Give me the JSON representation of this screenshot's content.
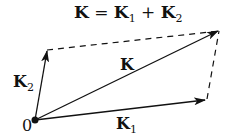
{
  "diagram": {
    "title": {
      "lhs": "K",
      "eq": " = ",
      "term1": "K",
      "term1_sub": "1",
      "plus": " + ",
      "term2": "K",
      "term2_sub": "2"
    },
    "origin_label": "0",
    "vectors": [
      {
        "name": "K1",
        "label": "K",
        "sub": "1",
        "from": [
          35,
          120
        ],
        "to": [
          206,
          100
        ]
      },
      {
        "name": "K2",
        "label": "K",
        "sub": "2",
        "from": [
          35,
          120
        ],
        "to": [
          47,
          50
        ]
      },
      {
        "name": "K",
        "label": "K",
        "sub": "",
        "from": [
          35,
          120
        ],
        "to": [
          219,
          31
        ]
      }
    ],
    "dashed_edges": [
      {
        "from": [
          47,
          50
        ],
        "to": [
          219,
          31
        ]
      },
      {
        "from": [
          206,
          100
        ],
        "to": [
          219,
          31
        ]
      }
    ],
    "colors": {
      "line": "#111111",
      "background": "#ffffff"
    }
  }
}
